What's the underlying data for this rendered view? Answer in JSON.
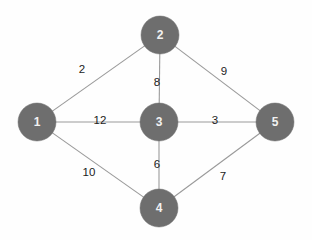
{
  "diagram": {
    "background_color": "#fefefe",
    "node_fill_color": "#6e6e6e",
    "node_label_color": "#f2f2f2",
    "edge_color": "#9a9a9a",
    "edge_label_color": "#1c1c1c",
    "node_radius": 19
  },
  "nodes": [
    {
      "id": "1",
      "label": "1",
      "cx": 37,
      "cy": 122
    },
    {
      "id": "2",
      "label": "2",
      "cx": 160,
      "cy": 35
    },
    {
      "id": "3",
      "label": "3",
      "cx": 159,
      "cy": 122
    },
    {
      "id": "4",
      "label": "4",
      "cx": 159,
      "cy": 208
    },
    {
      "id": "5",
      "label": "5",
      "cx": 275,
      "cy": 122
    }
  ],
  "edges": [
    {
      "from": "1",
      "to": "2",
      "weight": "2",
      "label_x": 82,
      "label_y": 70
    },
    {
      "from": "2",
      "to": "5",
      "weight": "9",
      "label_x": 224,
      "label_y": 72
    },
    {
      "from": "2",
      "to": "3",
      "weight": "8",
      "label_x": 157,
      "label_y": 83
    },
    {
      "from": "1",
      "to": "3",
      "weight": "12",
      "label_x": 100,
      "label_y": 121
    },
    {
      "from": "3",
      "to": "5",
      "weight": "3",
      "label_x": 215,
      "label_y": 121
    },
    {
      "from": "3",
      "to": "4",
      "weight": "6",
      "label_x": 157,
      "label_y": 165
    },
    {
      "from": "1",
      "to": "4",
      "weight": "10",
      "label_x": 89,
      "label_y": 173
    },
    {
      "from": "4",
      "to": "5",
      "weight": "7",
      "label_x": 223,
      "label_y": 177
    }
  ]
}
